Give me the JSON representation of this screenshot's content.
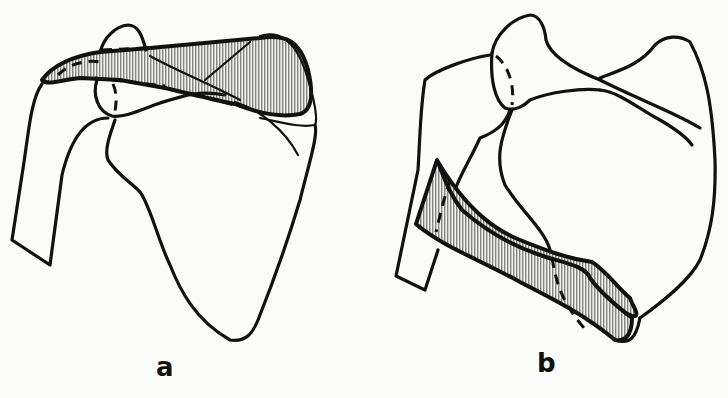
{
  "figure": {
    "panels": [
      {
        "id": "a",
        "label": "a",
        "hatched_region": "acromion / spine of scapula"
      },
      {
        "id": "b",
        "label": "b",
        "hatched_region": "lateral border band"
      }
    ],
    "colors": {
      "ink": "#111111",
      "paper": "#fbfbfa",
      "hatch": "#555555"
    }
  }
}
